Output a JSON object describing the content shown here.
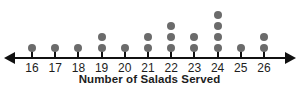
{
  "clipped_heading": "oal",
  "chart_data": {
    "type": "scatter",
    "plot_style": "dot-plot",
    "title": "",
    "xlabel": "Number of Salads Served",
    "ylabel": "",
    "categories": [
      "16",
      "17",
      "18",
      "19",
      "20",
      "21",
      "22",
      "23",
      "24",
      "25",
      "26"
    ],
    "values": [
      1,
      1,
      1,
      2,
      1,
      2,
      3,
      2,
      4,
      1,
      2
    ],
    "xlim": [
      16,
      26
    ],
    "ylim": [
      0,
      4
    ],
    "grid": false,
    "legend": false,
    "axis": {
      "tick_labels": [
        "16",
        "17",
        "18",
        "19",
        "20",
        "21",
        "22",
        "23",
        "24",
        "25",
        "26"
      ],
      "arrows_both_ends": true
    },
    "total_count": 20,
    "dot_color": "#6b6b6b",
    "axis_color": "#111111",
    "text_color": "#1d1d1d"
  }
}
